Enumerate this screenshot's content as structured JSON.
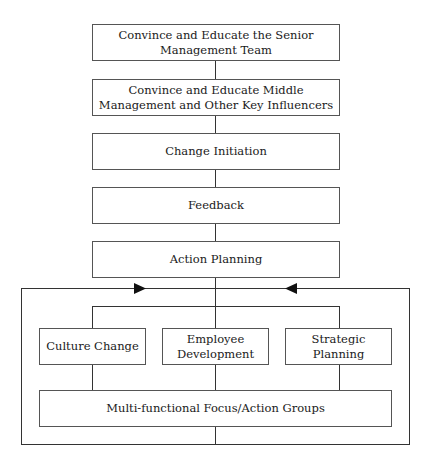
{
  "diagram": {
    "type": "flowchart",
    "steps": [
      {
        "label": "Convince and Educate the Senior Management Team"
      },
      {
        "label": "Convince and Educate Middle Management and Other Key Influencers"
      },
      {
        "label": "Change Initiation"
      },
      {
        "label": "Feedback"
      },
      {
        "label": "Action Planning"
      }
    ],
    "branches": [
      {
        "label": "Culture Change"
      },
      {
        "label": "Employee Development"
      },
      {
        "label": "Strategic Planning"
      }
    ],
    "bottom": {
      "label": "Multi-functional Focus/Action Groups"
    },
    "feedback_loop": {
      "arrows": [
        "right-pointing-left-side",
        "left-pointing-right-side"
      ]
    }
  }
}
